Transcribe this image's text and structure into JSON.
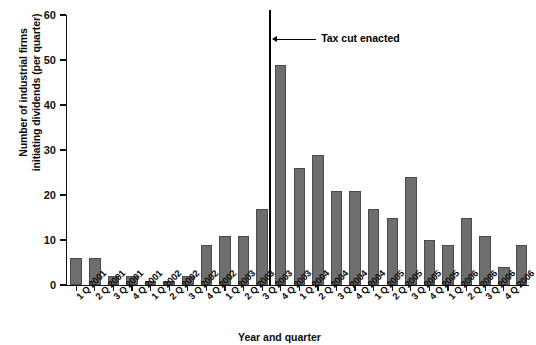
{
  "chart_data": {
    "type": "bar",
    "title": "",
    "xlabel": "Year and quarter",
    "ylabel": "Number of industrial firms initiating dividends (per quarter)",
    "ylabel_line1": "Number of industrial firms",
    "ylabel_line2": "initiating dividends (per quarter)",
    "ylim": [
      0,
      60
    ],
    "ytick_values": [
      0,
      10,
      20,
      30,
      40,
      50,
      60
    ],
    "ytick_labels": [
      "0",
      "10",
      "20",
      "30",
      "40",
      "50",
      "60"
    ],
    "grid": false,
    "legend": false,
    "bar_color": "#6e6e6e",
    "bar_edge_color": "#4a4a4a",
    "axis_color": "#111111",
    "categories": [
      "1 Q 2001",
      "2 Q 2001",
      "3 Q 2001",
      "4 Q 2001",
      "1 Q 2002",
      "2 Q 2002",
      "3 Q 2002",
      "4 Q 2002",
      "1 Q 2003",
      "2 Q 2003",
      "3 Q 2003",
      "4 Q 2003",
      "1 Q 2004",
      "2 Q 2004",
      "3 Q 2004",
      "4 Q 2004",
      "1 Q 2005",
      "2 Q 2005",
      "3 Q 2005",
      "4 Q 2005",
      "1 Q 2006",
      "2 Q 2006",
      "3 Q 2006",
      "4 Q 2006"
    ],
    "values": [
      6,
      6,
      2,
      2,
      1,
      1,
      2,
      9,
      11,
      11,
      17,
      49,
      26,
      29,
      21,
      21,
      17,
      15,
      24,
      10,
      9,
      15,
      11,
      4
    ],
    "annotations": [
      {
        "label": "Tax cut enacted",
        "type": "vertical-line-with-arrow",
        "at_category": "3 Q 2003",
        "position_note": "vertical rule between 3 Q 2003 and 4 Q 2003"
      }
    ],
    "trailing_bar_note": "final partial bar at right edge, value 9"
  }
}
